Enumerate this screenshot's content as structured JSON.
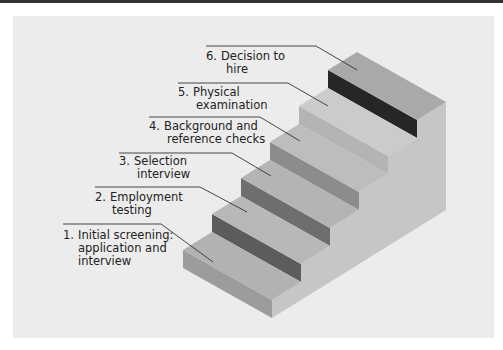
{
  "diagram": {
    "type": "staircase",
    "steps": [
      {
        "number": "1.",
        "line1": "Initial screening:",
        "line2": "application and",
        "line3": "interview"
      },
      {
        "number": "2.",
        "line1": "Employment",
        "line2": "testing"
      },
      {
        "number": "3.",
        "line1": "Selection",
        "line2": "interview"
      },
      {
        "number": "4.",
        "line1": "Background and",
        "line2": "reference checks"
      },
      {
        "number": "5.",
        "line1": "Physical",
        "line2": "examination"
      },
      {
        "number": "6.",
        "line1": "Decision to",
        "line2": "hire"
      }
    ],
    "colors": {
      "panel": "#ececec",
      "tread": [
        "#b2b2b2",
        "#b8b8b8",
        "#b4b4b4",
        "#bdbdbd",
        "#cbcbcb",
        "#a9a9a9"
      ],
      "riser": [
        "#9c9c9c",
        "#5c5c5c",
        "#6e6e6e",
        "#8c8c8c",
        "#b4b4b4",
        "#262626"
      ],
      "side": "#c6c6c6",
      "leader": "#333333"
    }
  }
}
